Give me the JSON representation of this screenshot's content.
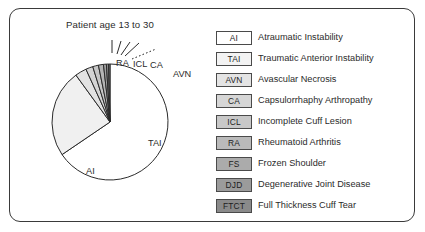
{
  "figure": {
    "title": "Patient age 13 to 30",
    "frame_color": "#3a3a3a",
    "background": "#ffffff"
  },
  "chart_data": {
    "type": "pie",
    "title": "Patient age 13 to 30",
    "xlabel": "",
    "ylabel": "",
    "grid": false,
    "legend_position": "right",
    "start_angle_deg": 90,
    "direction": "clockwise",
    "categories": [
      "AI",
      "TAI",
      "AVN",
      "CA",
      "ICL",
      "RA",
      "FS",
      "DJD",
      "FTCT"
    ],
    "values": [
      65.5,
      24.5,
      3.2,
      2.0,
      1.6,
      1.4,
      0.8,
      0.6,
      0.4
    ],
    "unit": "percent",
    "colors": [
      "#ffffff",
      "#f0f0f0",
      "#e2e2e2",
      "#d4d4d4",
      "#c6c6c6",
      "#b4b4b4",
      "#a2a2a2",
      "#8e8e8e",
      "#7a7a7a"
    ],
    "edge_color": "#2b2b2b",
    "labeled_slices": [
      "AI",
      "TAI",
      "RA",
      "ICL",
      "CA",
      "AVN"
    ],
    "annotations": [
      {
        "text": "AI",
        "slice": "AI",
        "placement": "inside"
      },
      {
        "text": "TAI",
        "slice": "TAI",
        "placement": "inside"
      },
      {
        "text": "RA",
        "slice": "RA",
        "placement": "leader"
      },
      {
        "text": "ICL",
        "slice": "ICL",
        "placement": "leader"
      },
      {
        "text": "CA",
        "slice": "CA",
        "placement": "leader"
      },
      {
        "text": "AVN",
        "slice": "AVN",
        "placement": "leader-dotted"
      }
    ]
  },
  "legend": {
    "items": [
      {
        "abbr": "AI",
        "label": "Atraumatic Instability",
        "color": "#ffffff"
      },
      {
        "abbr": "TAI",
        "label": "Traumatic Anterior Instability",
        "color": "#f3f3f3"
      },
      {
        "abbr": "AVN",
        "label": "Avascular Necrosis",
        "color": "#e4e4e4"
      },
      {
        "abbr": "CA",
        "label": "Capsulorrhaphy Arthropathy",
        "color": "#d6d6d6"
      },
      {
        "abbr": "ICL",
        "label": "Incomplete Cuff Lesion",
        "color": "#c8c8c8"
      },
      {
        "abbr": "RA",
        "label": "Rheumatoid Arthritis",
        "color": "#bababa"
      },
      {
        "abbr": "FS",
        "label": "Frozen Shoulder",
        "color": "#ababab"
      },
      {
        "abbr": "DJD",
        "label": "Degenerative Joint Disease",
        "color": "#9b9b9b"
      },
      {
        "abbr": "FTCT",
        "label": "Full Thickness Cuff Tear",
        "color": "#8a8a8a"
      }
    ]
  }
}
